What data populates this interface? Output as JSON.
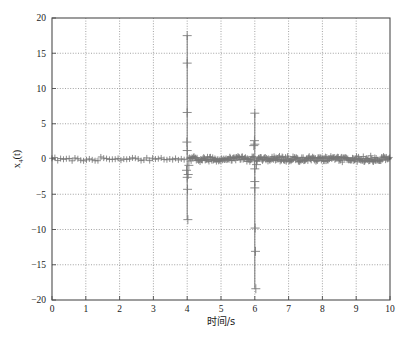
{
  "chart_data": {
    "type": "scatter",
    "title": "",
    "xlabel": "时间/s",
    "ylabel": "x4(t)",
    "ylabel_base": "x",
    "ylabel_sub": "4",
    "ylabel_arg": "(t)",
    "xlim": [
      0,
      10
    ],
    "ylim": [
      -20,
      20
    ],
    "xticks": [
      0,
      1,
      2,
      3,
      4,
      5,
      6,
      7,
      8,
      9,
      10
    ],
    "yticks": [
      -20,
      -15,
      -10,
      -5,
      0,
      5,
      10,
      15,
      20
    ],
    "xtick_labels": [
      "0",
      "1",
      "2",
      "3",
      "4",
      "5",
      "6",
      "7",
      "8",
      "9",
      "10"
    ],
    "ytick_labels": [
      "-20",
      "-15",
      "-10",
      "-5",
      "0",
      "5",
      "10",
      "15",
      "20"
    ],
    "grid": true,
    "grid_style": "dotted",
    "grid_color": "#8c8c8c",
    "axis_color": "#4d4d4d",
    "marker": "plus",
    "marker_color": "#777777",
    "marker_size": 3.0,
    "legend": null,
    "series": [
      {
        "name": "x4(t) residual signal",
        "description": "Near-zero residual with two large impulsive spikes at t=4 s and t=6 s",
        "segments": [
          {
            "name": "quiet-pre-fault",
            "t_start": 0.0,
            "t_end": 3.95,
            "sample_step": 0.085,
            "noise_amplitude": 0.32,
            "mean": 0.0
          },
          {
            "name": "spike-at-4s",
            "t_center": 4.0,
            "peak_max": 17.5,
            "peak_min": -8.6,
            "samples_t": [
              3.98,
              3.99,
              4.0,
              4.0,
              4.0,
              4.0,
              4.0,
              4.01,
              4.02,
              4.03,
              4.05
            ],
            "samples_y": [
              -1.6,
              2.4,
              17.5,
              13.6,
              6.6,
              1.2,
              -2.6,
              -4.3,
              -8.6,
              -2.2,
              -0.9
            ]
          },
          {
            "name": "noisy-mid-band",
            "t_start": 4.05,
            "t_end": 6.0,
            "sample_step": 0.022,
            "noise_amplitude": 0.55,
            "mean": 0.0
          },
          {
            "name": "spike-at-6s",
            "t_center": 6.0,
            "peak_max": 6.5,
            "peak_min": -18.4,
            "samples_t": [
              5.97,
              5.99,
              6.0,
              6.0,
              6.0,
              6.0,
              6.0,
              6.01,
              6.02,
              6.03,
              6.05
            ],
            "samples_y": [
              1.9,
              2.6,
              6.5,
              2.1,
              -1.4,
              -3.2,
              -4.1,
              -9.8,
              -13.1,
              -18.4,
              -0.8
            ]
          },
          {
            "name": "noisy-post-fault",
            "t_start": 6.05,
            "t_end": 10.0,
            "sample_step": 0.02,
            "noise_amplitude": 0.5,
            "mean": 0.0
          }
        ],
        "annotated_extremes": [
          {
            "t": 4.0,
            "y": 17.5
          },
          {
            "t": 4.0,
            "y": 13.6
          },
          {
            "t": 4.0,
            "y": 6.6
          },
          {
            "t": 4.02,
            "y": -8.6
          },
          {
            "t": 6.0,
            "y": 6.5
          },
          {
            "t": 6.03,
            "y": -18.4
          },
          {
            "t": 6.02,
            "y": -13.1
          },
          {
            "t": 6.01,
            "y": -9.8
          }
        ]
      }
    ]
  },
  "figure": {
    "background": "#ffffff",
    "plot_background": "#ffffff",
    "border_color": "#4d4d4d"
  }
}
